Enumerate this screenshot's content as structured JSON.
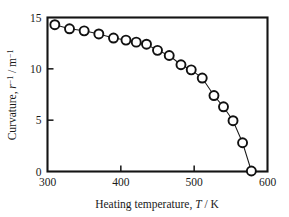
{
  "chart_data": {
    "type": "scatter",
    "title": "",
    "subtitle": "",
    "xlabel": "Heating temperature, T / K",
    "ylabel": "Curvature, r-1 / m-1",
    "xlabel_parts": {
      "prefix": "Heating temperature, ",
      "variable": "T",
      "suffix": " / K"
    },
    "ylabel_parts": {
      "prefix": "Curvature, ",
      "variable": "r",
      "variable_sup": "-1",
      "middle": " / m",
      "unit_sup": "-1"
    },
    "xlim": [
      300,
      600
    ],
    "ylim": [
      0,
      15
    ],
    "xticks": [
      300,
      400,
      500,
      600
    ],
    "yticks": [
      0,
      5,
      10,
      15
    ],
    "xtick_labels": [
      "300",
      "400",
      "500",
      "600"
    ],
    "ytick_labels": [
      "0",
      "5",
      "10",
      "15"
    ],
    "grid": false,
    "legend": null,
    "marker_style": "open-circle",
    "series": [
      {
        "name": "curvature",
        "x": [
          310,
          330,
          350,
          370,
          390,
          407,
          421,
          435,
          450,
          466,
          482,
          496,
          511,
          527,
          540,
          553,
          566,
          578
        ],
        "y": [
          14.3,
          13.9,
          13.7,
          13.4,
          13.0,
          12.8,
          12.6,
          12.4,
          11.8,
          11.3,
          10.4,
          9.9,
          9.1,
          7.4,
          6.3,
          4.95,
          2.8,
          0.05
        ]
      }
    ],
    "annotations": []
  }
}
